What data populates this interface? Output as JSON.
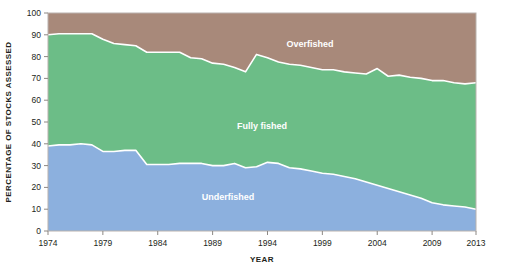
{
  "chart_data": {
    "type": "area",
    "title": "",
    "subtitle": "",
    "xlabel": "YEAR",
    "ylabel": "PERCENTAGE OF STOCKS ASSESSED",
    "xlim": [
      1974,
      2013
    ],
    "ylim": [
      0,
      100
    ],
    "grid": false,
    "stacked": true,
    "legend_position": "inline-annotations",
    "x_tick_labels": [
      "1974",
      "1979",
      "1984",
      "1989",
      "1994",
      "1999",
      "2004",
      "2009",
      "2013"
    ],
    "x_ticks": [
      1974,
      1979,
      1984,
      1989,
      1994,
      1999,
      2004,
      2009,
      2013
    ],
    "y_tick_labels": [
      "0",
      "10",
      "20",
      "30",
      "40",
      "50",
      "60",
      "70",
      "80",
      "90",
      "100"
    ],
    "y_ticks": [
      0,
      10,
      20,
      30,
      40,
      50,
      60,
      70,
      80,
      90,
      100
    ],
    "x": [
      1974,
      1975,
      1976,
      1977,
      1978,
      1979,
      1980,
      1981,
      1982,
      1983,
      1984,
      1985,
      1986,
      1987,
      1988,
      1989,
      1990,
      1991,
      1992,
      1993,
      1994,
      1995,
      1996,
      1997,
      1998,
      1999,
      2000,
      2001,
      2002,
      2003,
      2004,
      2005,
      2006,
      2007,
      2008,
      2009,
      2010,
      2011,
      2012,
      2013
    ],
    "series": [
      {
        "name": "Underfished",
        "color": "#8cb0de",
        "label": "Underfished",
        "values": [
          39,
          39.5,
          39.5,
          40,
          39.5,
          36.5,
          36.5,
          37,
          37,
          30.5,
          30.5,
          30.5,
          31,
          31,
          31,
          30,
          30,
          31,
          29,
          29.5,
          31.5,
          31,
          29,
          28.5,
          27.5,
          26.5,
          26,
          25,
          24,
          22.5,
          21,
          19.5,
          18,
          16.5,
          15,
          13,
          12,
          11.5,
          11,
          10
        ]
      },
      {
        "name": "Fully fished",
        "color": "#6cbd87",
        "label": "Fully fished",
        "values": [
          51,
          51,
          51,
          50.5,
          51,
          51.5,
          49.5,
          48.5,
          48,
          51.5,
          51.5,
          51.5,
          51,
          48.5,
          48,
          47,
          46.5,
          44,
          44,
          51.5,
          48,
          46.5,
          47.5,
          47.5,
          47.5,
          47.5,
          48,
          48,
          48.5,
          49.5,
          53.5,
          51.5,
          53.5,
          54,
          55,
          56,
          57,
          56.5,
          56.5,
          58
        ]
      },
      {
        "name": "Overfished",
        "color": "#a8897a",
        "label": "Overfished",
        "values": [
          10,
          9.5,
          9.5,
          9.5,
          9.5,
          12,
          14,
          14.5,
          15,
          18,
          18,
          18,
          18,
          20.5,
          21,
          23,
          23.5,
          25,
          27,
          19,
          20.5,
          22.5,
          23.5,
          24,
          25,
          26,
          26,
          27,
          27.5,
          28,
          25.5,
          29,
          28.5,
          29.5,
          30,
          31,
          31,
          32,
          32.5,
          32
        ]
      }
    ],
    "cumulative_upper_underfished": [
      39,
      39.5,
      39.5,
      40,
      39.5,
      36.5,
      36.5,
      37,
      37,
      30.5,
      30.5,
      30.5,
      31,
      31,
      31,
      30,
      30,
      31,
      29,
      29.5,
      31.5,
      31,
      29,
      28.5,
      27.5,
      26.5,
      26,
      25,
      24,
      22.5,
      21,
      19.5,
      18,
      16.5,
      15,
      13,
      12,
      11.5,
      11,
      10
    ],
    "cumulative_upper_fullyfished": [
      90,
      90.5,
      90.5,
      90.5,
      90.5,
      88,
      86,
      85.5,
      85,
      82,
      82,
      82,
      82,
      79.5,
      79,
      77,
      76.5,
      75,
      73,
      81,
      79.5,
      77.5,
      76.5,
      76,
      75,
      74,
      74,
      73,
      72.5,
      72,
      74.5,
      71,
      71.5,
      70.5,
      70,
      69,
      69,
      68,
      67.5,
      68
    ]
  },
  "labels": {
    "overfished": "Overfished",
    "fully_fished": "Fully fished",
    "underfished": "Underfished",
    "y_axis_title": "PERCENTAGE OF STOCKS ASSESSED",
    "x_axis_title": "YEAR"
  },
  "colors": {
    "overfished": "#a8897a",
    "fully_fished": "#6cbd87",
    "underfished": "#8cb0de",
    "boundary": "#ffffff",
    "background": "#ffffff",
    "axis_text": "#231f20",
    "frame": "#b9b2ad"
  }
}
